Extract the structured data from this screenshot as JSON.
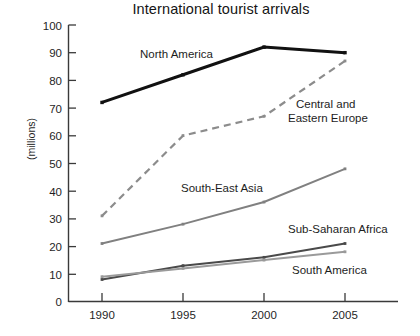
{
  "chart": {
    "title": "International tourist arrivals",
    "ylabel": "(millions)"
  },
  "chart_data": {
    "type": "line",
    "title": "International tourist arrivals",
    "xlabel": "",
    "ylabel": "(millions)",
    "x": [
      1990,
      1995,
      2000,
      2005
    ],
    "xtick_labels": [
      "1990",
      "1995",
      "2000",
      "2005"
    ],
    "ytick_labels": [
      "0",
      "10",
      "20",
      "30",
      "40",
      "50",
      "60",
      "70",
      "80",
      "90",
      "100"
    ],
    "ylim": [
      0,
      100
    ],
    "ytick_step": 10,
    "grid": false,
    "legend_position": "inline-annotations",
    "series": [
      {
        "name": "North America",
        "values": [
          72,
          82,
          92,
          90
        ],
        "color": "#111111",
        "style": "solid-thick",
        "label_x": 140,
        "label_y": 58
      },
      {
        "name": "Central and Eastern Europe",
        "values": [
          31,
          60,
          67,
          87
        ],
        "color": "#8c8c8c",
        "style": "dashed",
        "label_x": 296,
        "label_y": 108,
        "label_line2_y": 122
      },
      {
        "name": "South-East Asia",
        "values": [
          21,
          28,
          36,
          48
        ],
        "color": "#808080",
        "style": "solid",
        "label_x": 181,
        "label_y": 192
      },
      {
        "name": "Sub-Saharan Africa",
        "values": [
          8,
          13,
          16,
          21
        ],
        "color": "#4a4a4a",
        "style": "solid",
        "label_x": 288,
        "label_y": 233
      },
      {
        "name": "South America",
        "values": [
          9,
          12,
          15,
          18
        ],
        "color": "#9a9a9a",
        "style": "solid",
        "label_x": 292,
        "label_y": 274
      }
    ],
    "annotations": [
      "North America",
      "Central and",
      "Eastern Europe",
      "South-East Asia",
      "Sub-Saharan Africa",
      "South America"
    ]
  }
}
